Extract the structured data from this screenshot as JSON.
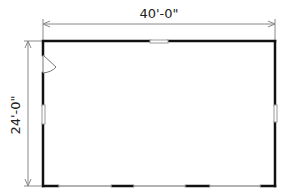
{
  "plan": {
    "title": "Floor plan",
    "width_label": "40'-0\"",
    "depth_label": "24'-0\"",
    "colors": {
      "wall": "#111111",
      "dimension": "#888888",
      "opening": "#999999"
    },
    "openings": [
      {
        "type": "window",
        "wall": "top"
      },
      {
        "type": "window",
        "wall": "left"
      },
      {
        "type": "window",
        "wall": "right"
      },
      {
        "type": "door",
        "wall": "left",
        "swing": true
      },
      {
        "type": "overhead-door",
        "wall": "bottom"
      },
      {
        "type": "overhead-door",
        "wall": "bottom"
      },
      {
        "type": "overhead-door",
        "wall": "bottom"
      }
    ]
  }
}
